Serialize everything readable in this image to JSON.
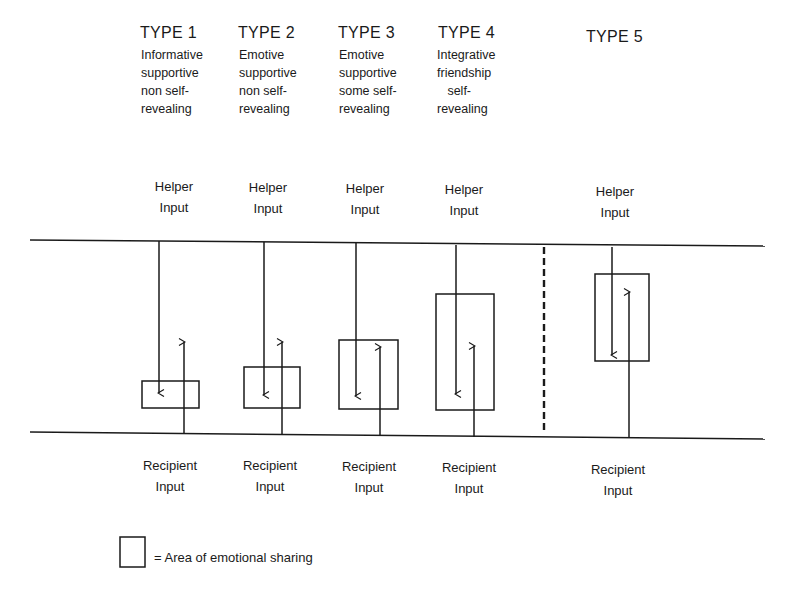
{
  "types": [
    {
      "title": "TYPE 1",
      "description": "Informative\nsupportive\nnon self-\nrevealing",
      "helper_label": "Helper\nInput",
      "recipient_label": "Recipient\nInput"
    },
    {
      "title": "TYPE 2",
      "description": "Emotive\nsupportive\nnon self-\nrevealing",
      "helper_label": "Helper\nInput",
      "recipient_label": "Recipient\nInput"
    },
    {
      "title": "TYPE 3",
      "description": "Emotive\nsupportive\nsome self-\nrevealing",
      "helper_label": "Helper\nInput",
      "recipient_label": "Recipient\nInput"
    },
    {
      "title": "TYPE 4",
      "description": "Integrative\nfriendship\n   self-\nrevealing",
      "helper_label": "Helper\nInput",
      "recipient_label": "Recipient\nInput"
    },
    {
      "title": "TYPE 5",
      "description": "",
      "helper_label": "Helper\nInput",
      "recipient_label": "Recipient\nInput"
    }
  ],
  "legend": {
    "text": "= Area of emotional sharing"
  },
  "colors": {
    "ink": "#1a1a1a",
    "background": "#ffffff"
  }
}
